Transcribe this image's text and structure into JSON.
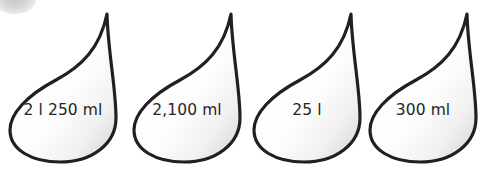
{
  "worksheet": {
    "background_color": "#ffffff",
    "corner_mark": {
      "icon": "faint-grey-circle",
      "color": "#c4c4c4"
    },
    "droplets": [
      {
        "label": "2 l 250 ml",
        "shape": "water-droplet"
      },
      {
        "label": "2,100 ml",
        "shape": "water-droplet"
      },
      {
        "label": "25 l",
        "shape": "water-droplet"
      },
      {
        "label": "300 ml",
        "shape": "water-droplet"
      }
    ],
    "style": {
      "outline_color": "#231f20",
      "fill_color": "#fefefe",
      "shade_color": "#d8d8d8",
      "text_color": "#262626"
    }
  }
}
